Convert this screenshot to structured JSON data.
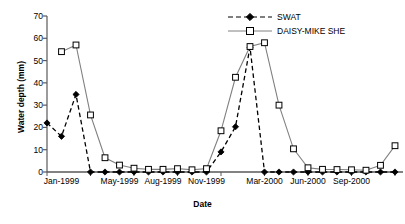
{
  "chart_data": {
    "type": "line",
    "title": "",
    "xlabel": "Date",
    "ylabel": "Water depth (mm)",
    "ylim": [
      0,
      70
    ],
    "yticks": [
      0,
      10,
      20,
      30,
      40,
      50,
      60,
      70
    ],
    "grid": false,
    "legend_position": "top-right",
    "x": [
      "Dec-1998",
      "Jan-1999",
      "Feb-1999",
      "Mar-1999",
      "Apr-1999",
      "May-1999",
      "Jun-1999",
      "Jul-1999",
      "Aug-1999",
      "Sep-1999",
      "Oct-1999",
      "Nov-1999",
      "Dec-1999",
      "Jan-2000",
      "Feb-2000",
      "Mar-2000",
      "Apr-2000",
      "May-2000",
      "Jun-2000",
      "Jul-2000",
      "Aug-2000",
      "Sep-2000",
      "Oct-2000",
      "Nov-2000",
      "Dec-2000"
    ],
    "xtick_labels": [
      "Jan-1999",
      "May-1999",
      "Aug-1999",
      "Nov-1999",
      "Mar-2000",
      "Jun-2000",
      "Sep-2000"
    ],
    "xtick_indices": [
      1,
      5,
      8,
      11,
      15,
      18,
      21
    ],
    "series": [
      {
        "name": "SWAT",
        "marker": "filled-diamond",
        "line_style": "dashed",
        "color": "#000000",
        "values": [
          22,
          16,
          34.8,
          0,
          0,
          0,
          0,
          0,
          0,
          0,
          0,
          0,
          9,
          20.3,
          56,
          0,
          0,
          0,
          0,
          0,
          0,
          0,
          0,
          0,
          0
        ]
      },
      {
        "name": "DAISY-MIKE SHE",
        "marker": "open-square",
        "line_style": "solid",
        "color": "#808080",
        "values": [
          null,
          54,
          57,
          25.6,
          6.4,
          3.1,
          1.7,
          1.2,
          1.2,
          1.5,
          1.0,
          1.5,
          18.5,
          42.5,
          56.3,
          58,
          30,
          10.4,
          1.9,
          1.2,
          1.1,
          1.0,
          0.8,
          3.0,
          11.8
        ]
      }
    ]
  },
  "axis": {
    "y_tick_labels": [
      "0",
      "10",
      "20",
      "30",
      "40",
      "50",
      "60",
      "70"
    ]
  }
}
